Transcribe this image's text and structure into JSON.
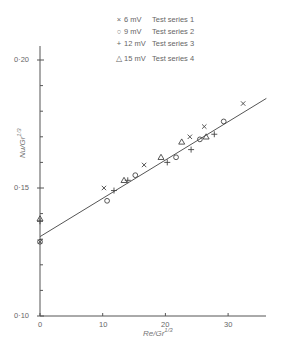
{
  "chart_data": {
    "type": "scatter",
    "title": "",
    "xlabel": "Re/Gr^1/3",
    "ylabel": "Nu/Gr^1/3",
    "xlim": [
      0,
      36
    ],
    "ylim": [
      0.1,
      0.2
    ],
    "x_ticks": [
      0,
      10,
      20,
      30
    ],
    "y_ticks_labeled": [
      "0·10",
      "0·15",
      "0·20"
    ],
    "grid": false,
    "legend_position": "top-center",
    "series": [
      {
        "name": "Test series 1",
        "voltage": "6 mV",
        "marker": "x",
        "points": [
          [
            0,
            0.129
          ],
          [
            10.2,
            0.15
          ],
          [
            16.6,
            0.159
          ],
          [
            23.9,
            0.17
          ],
          [
            26.2,
            0.174
          ],
          [
            32.4,
            0.183
          ]
        ]
      },
      {
        "name": "Test series 2",
        "voltage": "9 mV",
        "marker": "o",
        "points": [
          [
            0,
            0.129
          ],
          [
            10.7,
            0.145
          ],
          [
            15.2,
            0.155
          ],
          [
            21.7,
            0.162
          ],
          [
            25.5,
            0.169
          ],
          [
            29.3,
            0.176
          ]
        ]
      },
      {
        "name": "Test series 3",
        "voltage": "12 mV",
        "marker": "+",
        "points": [
          [
            0,
            0.137
          ],
          [
            11.8,
            0.149
          ],
          [
            14.0,
            0.153
          ],
          [
            20.3,
            0.16
          ],
          [
            24.1,
            0.165
          ],
          [
            27.8,
            0.171
          ]
        ]
      },
      {
        "name": "Test series 4",
        "voltage": "15 mV",
        "marker": "triangle",
        "points": [
          [
            0,
            0.138
          ],
          [
            13.4,
            0.153
          ],
          [
            19.3,
            0.162
          ],
          [
            22.6,
            0.168
          ],
          [
            26.5,
            0.17
          ]
        ]
      }
    ],
    "fit_line": {
      "x": [
        0,
        36.1
      ],
      "y": [
        0.131,
        0.185
      ]
    }
  },
  "legend": [
    {
      "symbol": "×",
      "voltage": "6 mV",
      "name": "Test series 1"
    },
    {
      "symbol": "○",
      "voltage": "9 mV",
      "name": "Test series 2"
    },
    {
      "symbol": "+",
      "voltage": "12 mV",
      "name": "Test series 3"
    },
    {
      "symbol": "△",
      "voltage": "15 mV",
      "name": "Test series 4"
    }
  ],
  "axes": {
    "x_tick_labels": [
      "0",
      "10",
      "20",
      "30"
    ],
    "y_tick_labels": [
      "0·10",
      "0·15",
      "0·20"
    ],
    "xlabel_main": "Re/Gr",
    "xlabel_sup": "1/3",
    "ylabel_main": "Nu/Gr",
    "ylabel_sup": "1/3"
  }
}
